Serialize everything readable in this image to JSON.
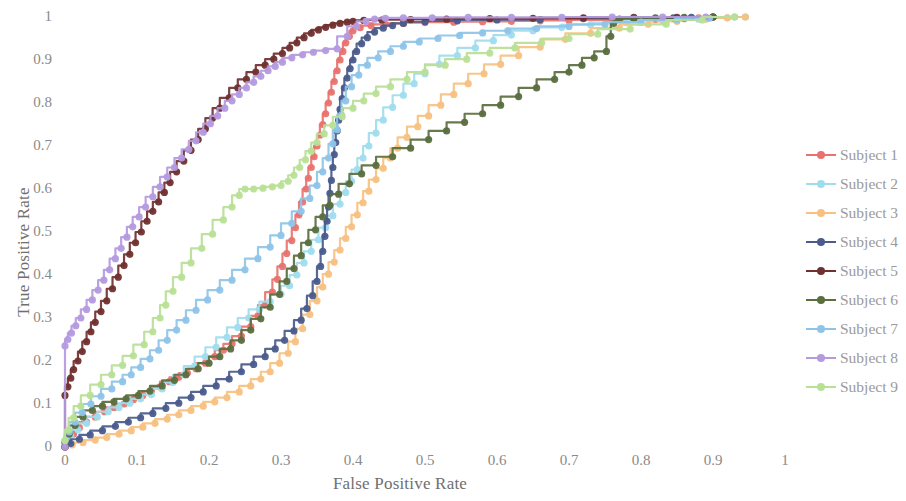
{
  "chart_data": {
    "type": "line",
    "title": "",
    "xlabel": "False Positive Rate",
    "ylabel": "True Positive Rate",
    "xlim": [
      0,
      1
    ],
    "ylim": [
      0,
      1
    ],
    "grid": false,
    "legend_position": "right",
    "markers": true,
    "xticks": [
      "0",
      "0.1",
      "0.2",
      "0.3",
      "0.4",
      "0.5",
      "0.6",
      "0.7",
      "0.8",
      "0.9",
      "1"
    ],
    "xtick_values": [
      0,
      0.1,
      0.2,
      0.3,
      0.4,
      0.5,
      0.6,
      0.7,
      0.8,
      0.9,
      1
    ],
    "yticks": [
      "0",
      "0.1",
      "0.2",
      "0.3",
      "0.4",
      "0.5",
      "0.6",
      "0.7",
      "0.8",
      "0.9",
      "1"
    ],
    "ytick_values": [
      0,
      0.1,
      0.2,
      0.3,
      0.4,
      0.5,
      0.6,
      0.7,
      0.8,
      0.9,
      1
    ],
    "series": [
      {
        "name": "Subject 1",
        "color": "#e8736e",
        "x": [
          0.0,
          0.005,
          0.012,
          0.02,
          0.03,
          0.042,
          0.055,
          0.068,
          0.082,
          0.095,
          0.108,
          0.12,
          0.132,
          0.145,
          0.158,
          0.17,
          0.182,
          0.195,
          0.208,
          0.22,
          0.232,
          0.245,
          0.258,
          0.268,
          0.278,
          0.288,
          0.295,
          0.302,
          0.308,
          0.315,
          0.32,
          0.325,
          0.33,
          0.335,
          0.338,
          0.342,
          0.346,
          0.35,
          0.354,
          0.358,
          0.362,
          0.366,
          0.37,
          0.374,
          0.378,
          0.382,
          0.386,
          0.39,
          0.395,
          0.4,
          0.41,
          0.425,
          0.445,
          0.47,
          0.5,
          0.54,
          0.58,
          0.62,
          0.66,
          0.7,
          0.76,
          0.82,
          0.86,
          0.88,
          0.9
        ],
        "y": [
          0.0,
          0.015,
          0.03,
          0.045,
          0.058,
          0.07,
          0.082,
          0.092,
          0.1,
          0.11,
          0.12,
          0.13,
          0.14,
          0.152,
          0.162,
          0.172,
          0.182,
          0.195,
          0.21,
          0.225,
          0.24,
          0.258,
          0.28,
          0.305,
          0.33,
          0.36,
          0.39,
          0.42,
          0.45,
          0.48,
          0.51,
          0.54,
          0.57,
          0.6,
          0.625,
          0.65,
          0.675,
          0.7,
          0.725,
          0.75,
          0.775,
          0.8,
          0.825,
          0.85,
          0.875,
          0.9,
          0.92,
          0.94,
          0.955,
          0.968,
          0.975,
          0.98,
          0.983,
          0.985,
          0.987,
          0.988,
          0.989,
          0.99,
          0.991,
          0.992,
          0.993,
          0.994,
          0.996,
          0.998,
          1.0
        ]
      },
      {
        "name": "Subject 2",
        "color": "#9fdcee",
        "x": [
          0.0,
          0.008,
          0.018,
          0.03,
          0.045,
          0.06,
          0.075,
          0.09,
          0.105,
          0.12,
          0.135,
          0.15,
          0.165,
          0.18,
          0.195,
          0.21,
          0.225,
          0.24,
          0.255,
          0.27,
          0.285,
          0.3,
          0.312,
          0.322,
          0.332,
          0.342,
          0.352,
          0.362,
          0.372,
          0.382,
          0.39,
          0.398,
          0.406,
          0.414,
          0.422,
          0.432,
          0.442,
          0.455,
          0.47,
          0.485,
          0.5,
          0.52,
          0.545,
          0.57,
          0.595,
          0.62,
          0.65,
          0.69,
          0.73,
          0.78,
          0.83,
          0.88,
          0.92,
          0.945
        ],
        "y": [
          0.01,
          0.025,
          0.04,
          0.055,
          0.07,
          0.082,
          0.092,
          0.102,
          0.112,
          0.122,
          0.135,
          0.15,
          0.168,
          0.188,
          0.21,
          0.232,
          0.255,
          0.278,
          0.3,
          0.32,
          0.338,
          0.355,
          0.375,
          0.4,
          0.428,
          0.455,
          0.482,
          0.51,
          0.538,
          0.565,
          0.592,
          0.618,
          0.645,
          0.672,
          0.7,
          0.73,
          0.76,
          0.79,
          0.818,
          0.845,
          0.868,
          0.89,
          0.91,
          0.928,
          0.945,
          0.958,
          0.968,
          0.976,
          0.982,
          0.987,
          0.992,
          0.995,
          0.998,
          1.0
        ]
      },
      {
        "name": "Subject 3",
        "color": "#f7c181",
        "x": [
          0.0,
          0.01,
          0.025,
          0.042,
          0.058,
          0.075,
          0.092,
          0.108,
          0.125,
          0.142,
          0.158,
          0.175,
          0.192,
          0.208,
          0.225,
          0.242,
          0.258,
          0.272,
          0.285,
          0.298,
          0.31,
          0.32,
          0.33,
          0.34,
          0.35,
          0.358,
          0.366,
          0.374,
          0.382,
          0.39,
          0.398,
          0.406,
          0.414,
          0.422,
          0.432,
          0.442,
          0.452,
          0.462,
          0.475,
          0.49,
          0.505,
          0.522,
          0.54,
          0.56,
          0.582,
          0.605,
          0.63,
          0.66,
          0.695,
          0.73,
          0.77,
          0.81,
          0.85,
          0.89,
          0.92,
          0.945
        ],
        "y": [
          0.0,
          0.005,
          0.01,
          0.016,
          0.022,
          0.03,
          0.038,
          0.046,
          0.055,
          0.065,
          0.075,
          0.085,
          0.095,
          0.105,
          0.115,
          0.128,
          0.142,
          0.158,
          0.175,
          0.195,
          0.218,
          0.245,
          0.275,
          0.308,
          0.34,
          0.372,
          0.402,
          0.43,
          0.458,
          0.485,
          0.512,
          0.54,
          0.568,
          0.595,
          0.622,
          0.648,
          0.672,
          0.695,
          0.72,
          0.745,
          0.77,
          0.795,
          0.82,
          0.845,
          0.868,
          0.89,
          0.91,
          0.93,
          0.948,
          0.962,
          0.974,
          0.983,
          0.99,
          0.995,
          0.998,
          1.0
        ]
      },
      {
        "name": "Subject 4",
        "color": "#4a5b8c",
        "x": [
          0.0,
          0.008,
          0.02,
          0.035,
          0.052,
          0.07,
          0.088,
          0.105,
          0.122,
          0.14,
          0.158,
          0.175,
          0.192,
          0.21,
          0.228,
          0.245,
          0.262,
          0.278,
          0.292,
          0.305,
          0.318,
          0.328,
          0.336,
          0.344,
          0.35,
          0.355,
          0.358,
          0.361,
          0.364,
          0.366,
          0.368,
          0.37,
          0.372,
          0.374,
          0.376,
          0.378,
          0.38,
          0.382,
          0.385,
          0.388,
          0.392,
          0.396,
          0.4,
          0.405,
          0.412,
          0.42,
          0.43,
          0.442,
          0.455,
          0.47,
          0.5,
          0.545,
          0.6,
          0.66,
          0.72,
          0.79,
          0.845,
          0.87,
          0.9
        ],
        "y": [
          0.0,
          0.008,
          0.018,
          0.028,
          0.038,
          0.048,
          0.058,
          0.068,
          0.078,
          0.09,
          0.102,
          0.115,
          0.128,
          0.142,
          0.158,
          0.175,
          0.192,
          0.21,
          0.228,
          0.248,
          0.27,
          0.295,
          0.322,
          0.352,
          0.385,
          0.42,
          0.455,
          0.49,
          0.525,
          0.558,
          0.59,
          0.62,
          0.65,
          0.68,
          0.708,
          0.735,
          0.76,
          0.785,
          0.81,
          0.835,
          0.858,
          0.88,
          0.9,
          0.92,
          0.938,
          0.952,
          0.965,
          0.974,
          0.98,
          0.985,
          0.989,
          0.991,
          0.993,
          0.994,
          0.996,
          0.997,
          0.998,
          0.999,
          1.0
        ]
      },
      {
        "name": "Subject 5",
        "color": "#70302f",
        "x": [
          0.0,
          0.0,
          0.004,
          0.008,
          0.012,
          0.018,
          0.024,
          0.03,
          0.036,
          0.042,
          0.05,
          0.058,
          0.066,
          0.074,
          0.082,
          0.09,
          0.098,
          0.106,
          0.114,
          0.122,
          0.13,
          0.138,
          0.146,
          0.155,
          0.165,
          0.175,
          0.185,
          0.195,
          0.205,
          0.215,
          0.228,
          0.24,
          0.252,
          0.265,
          0.278,
          0.29,
          0.302,
          0.312,
          0.322,
          0.332,
          0.342,
          0.352,
          0.362,
          0.372,
          0.382,
          0.392,
          0.4,
          0.415,
          0.44,
          0.48,
          0.53,
          0.59,
          0.65,
          0.72,
          0.79,
          0.85,
          0.9
        ],
        "y": [
          0.0,
          0.12,
          0.14,
          0.16,
          0.18,
          0.2,
          0.222,
          0.245,
          0.268,
          0.29,
          0.315,
          0.34,
          0.368,
          0.395,
          0.422,
          0.448,
          0.475,
          0.5,
          0.525,
          0.548,
          0.57,
          0.592,
          0.615,
          0.64,
          0.665,
          0.69,
          0.715,
          0.74,
          0.765,
          0.788,
          0.812,
          0.835,
          0.855,
          0.872,
          0.888,
          0.902,
          0.915,
          0.928,
          0.94,
          0.952,
          0.962,
          0.97,
          0.976,
          0.981,
          0.985,
          0.988,
          0.99,
          0.992,
          0.993,
          0.994,
          0.995,
          0.996,
          0.997,
          0.998,
          0.999,
          0.999,
          1.0
        ]
      },
      {
        "name": "Subject 6",
        "color": "#5a6e3e",
        "x": [
          0.0,
          0.006,
          0.014,
          0.025,
          0.038,
          0.052,
          0.068,
          0.085,
          0.102,
          0.118,
          0.135,
          0.152,
          0.168,
          0.185,
          0.2,
          0.215,
          0.23,
          0.245,
          0.258,
          0.272,
          0.285,
          0.298,
          0.308,
          0.318,
          0.328,
          0.338,
          0.348,
          0.358,
          0.368,
          0.38,
          0.395,
          0.412,
          0.432,
          0.455,
          0.48,
          0.505,
          0.53,
          0.555,
          0.58,
          0.605,
          0.63,
          0.655,
          0.68,
          0.7,
          0.718,
          0.735,
          0.752,
          0.758,
          0.762,
          0.77,
          0.79,
          0.82,
          0.86,
          0.9
        ],
        "y": [
          0.01,
          0.03,
          0.05,
          0.07,
          0.085,
          0.095,
          0.105,
          0.112,
          0.12,
          0.13,
          0.142,
          0.155,
          0.168,
          0.182,
          0.195,
          0.21,
          0.228,
          0.248,
          0.272,
          0.298,
          0.325,
          0.355,
          0.385,
          0.415,
          0.445,
          0.475,
          0.505,
          0.535,
          0.562,
          0.588,
          0.612,
          0.635,
          0.655,
          0.675,
          0.695,
          0.715,
          0.735,
          0.755,
          0.775,
          0.795,
          0.815,
          0.835,
          0.855,
          0.872,
          0.888,
          0.905,
          0.92,
          0.955,
          0.985,
          0.995,
          0.997,
          0.998,
          0.999,
          1.0
        ]
      },
      {
        "name": "Subject 7",
        "color": "#8ec4e8",
        "x": [
          0.0,
          0.006,
          0.014,
          0.024,
          0.036,
          0.05,
          0.065,
          0.08,
          0.092,
          0.105,
          0.118,
          0.13,
          0.142,
          0.155,
          0.168,
          0.182,
          0.198,
          0.215,
          0.232,
          0.25,
          0.268,
          0.285,
          0.3,
          0.315,
          0.328,
          0.34,
          0.35,
          0.358,
          0.366,
          0.372,
          0.378,
          0.384,
          0.39,
          0.398,
          0.408,
          0.42,
          0.435,
          0.452,
          0.47,
          0.492,
          0.518,
          0.548,
          0.58,
          0.615,
          0.655,
          0.7,
          0.75,
          0.8,
          0.85,
          0.895,
          0.93
        ],
        "y": [
          0.015,
          0.035,
          0.058,
          0.08,
          0.1,
          0.118,
          0.135,
          0.152,
          0.168,
          0.185,
          0.205,
          0.225,
          0.248,
          0.272,
          0.295,
          0.318,
          0.342,
          0.365,
          0.388,
          0.412,
          0.438,
          0.465,
          0.492,
          0.52,
          0.548,
          0.578,
          0.608,
          0.64,
          0.672,
          0.705,
          0.738,
          0.772,
          0.805,
          0.838,
          0.865,
          0.888,
          0.905,
          0.92,
          0.932,
          0.942,
          0.95,
          0.957,
          0.963,
          0.968,
          0.973,
          0.978,
          0.983,
          0.988,
          0.993,
          0.997,
          1.0
        ]
      },
      {
        "name": "Subject 8",
        "color": "#b49adf",
        "x": [
          0.0,
          0.0,
          0.004,
          0.009,
          0.015,
          0.022,
          0.03,
          0.038,
          0.046,
          0.054,
          0.062,
          0.07,
          0.078,
          0.086,
          0.094,
          0.103,
          0.112,
          0.122,
          0.132,
          0.142,
          0.152,
          0.162,
          0.172,
          0.182,
          0.192,
          0.202,
          0.212,
          0.222,
          0.232,
          0.242,
          0.252,
          0.262,
          0.272,
          0.282,
          0.292,
          0.302,
          0.315,
          0.33,
          0.345,
          0.362,
          0.378,
          0.392,
          0.405,
          0.418,
          0.43,
          0.445,
          0.47,
          0.51,
          0.56,
          0.62,
          0.69,
          0.76,
          0.83,
          0.89
        ],
        "y": [
          0.0,
          0.235,
          0.25,
          0.265,
          0.282,
          0.3,
          0.32,
          0.342,
          0.365,
          0.388,
          0.412,
          0.438,
          0.462,
          0.488,
          0.512,
          0.535,
          0.558,
          0.582,
          0.605,
          0.628,
          0.65,
          0.672,
          0.692,
          0.712,
          0.732,
          0.752,
          0.77,
          0.788,
          0.805,
          0.82,
          0.835,
          0.848,
          0.862,
          0.875,
          0.885,
          0.895,
          0.905,
          0.912,
          0.918,
          0.922,
          0.926,
          0.955,
          0.978,
          0.99,
          0.995,
          0.997,
          0.998,
          0.998,
          0.999,
          0.999,
          0.999,
          1.0,
          1.0,
          1.0
        ]
      },
      {
        "name": "Subject 9",
        "color": "#b8e096",
        "x": [
          0.0,
          0.005,
          0.012,
          0.022,
          0.035,
          0.05,
          0.065,
          0.08,
          0.095,
          0.11,
          0.122,
          0.132,
          0.14,
          0.15,
          0.162,
          0.175,
          0.19,
          0.205,
          0.22,
          0.232,
          0.242,
          0.25,
          0.262,
          0.275,
          0.288,
          0.3,
          0.31,
          0.318,
          0.326,
          0.334,
          0.342,
          0.35,
          0.36,
          0.372,
          0.385,
          0.4,
          0.415,
          0.432,
          0.452,
          0.475,
          0.5,
          0.528,
          0.558,
          0.59,
          0.625,
          0.662,
          0.7,
          0.74,
          0.785,
          0.835,
          0.885,
          0.93
        ],
        "y": [
          0.015,
          0.04,
          0.068,
          0.095,
          0.12,
          0.145,
          0.168,
          0.19,
          0.212,
          0.238,
          0.268,
          0.3,
          0.33,
          0.362,
          0.395,
          0.428,
          0.462,
          0.495,
          0.528,
          0.558,
          0.585,
          0.6,
          0.6,
          0.602,
          0.605,
          0.608,
          0.618,
          0.632,
          0.65,
          0.668,
          0.688,
          0.708,
          0.728,
          0.748,
          0.768,
          0.788,
          0.805,
          0.822,
          0.838,
          0.855,
          0.872,
          0.888,
          0.902,
          0.916,
          0.928,
          0.94,
          0.95,
          0.96,
          0.972,
          0.983,
          0.993,
          1.0
        ]
      }
    ]
  },
  "legend": {
    "items": [
      {
        "label": "Subject 1",
        "color": "#e8736e"
      },
      {
        "label": "Subject 2",
        "color": "#9fdcee"
      },
      {
        "label": "Subject 3",
        "color": "#f7c181"
      },
      {
        "label": "Subject 4",
        "color": "#4a5b8c"
      },
      {
        "label": "Subject 5",
        "color": "#70302f"
      },
      {
        "label": "Subject 6",
        "color": "#5a6e3e"
      },
      {
        "label": "Subject 7",
        "color": "#8ec4e8"
      },
      {
        "label": "Subject 8",
        "color": "#b49adf"
      },
      {
        "label": "Subject 9",
        "color": "#b8e096"
      }
    ]
  },
  "axes": {
    "x_title": "False Positive Rate",
    "y_title": "True Positive Rate"
  }
}
